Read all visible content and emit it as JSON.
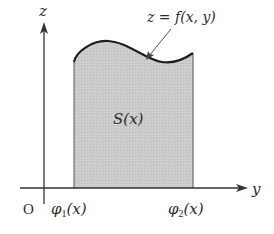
{
  "diagram": {
    "axes": {
      "vertical_label": "z",
      "horizontal_label": "y",
      "origin_label": "O"
    },
    "region": {
      "label": "S(x)",
      "fill_color": "#c8c8c8",
      "lower_bound_label": "φ",
      "lower_bound_sub": "1",
      "lower_bound_arg": "(x)",
      "upper_bound_label": "φ",
      "upper_bound_sub": "2",
      "upper_bound_arg": "(x)"
    },
    "surface": {
      "label": "z = f(x, y)"
    },
    "colors": {
      "line": "#1e1e1e",
      "axis": "#333333",
      "fill": "#c8c8c8",
      "text": "#2a2a2a"
    }
  }
}
